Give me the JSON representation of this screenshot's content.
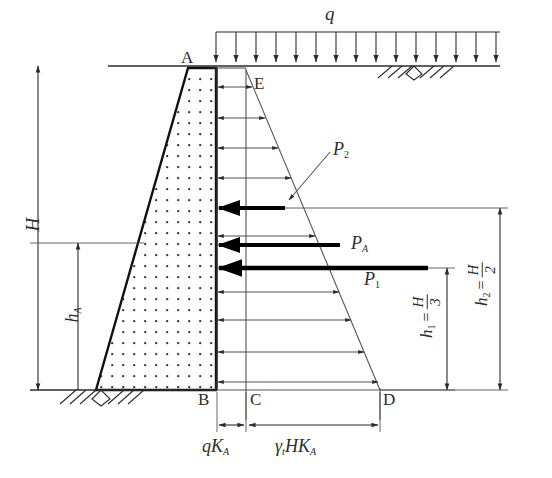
{
  "figure": {
    "type": "engineering-diagram",
    "colors": {
      "line": "#2b2b2b",
      "thin_line": "#555555",
      "bold_force": "#000000",
      "fill_dots": "#333333",
      "background": "#ffffff"
    }
  },
  "loads": {
    "surcharge_label": "q",
    "surcharge_arrow_count": 15
  },
  "points": {
    "A": "A",
    "B": "B",
    "C": "C",
    "D": "D",
    "E": "E"
  },
  "forces": [
    {
      "name": "P_2",
      "base": "P",
      "sub": "2"
    },
    {
      "name": "P_A",
      "base": "P",
      "sub": "A"
    },
    {
      "name": "P_1",
      "base": "P",
      "sub": "1"
    }
  ],
  "dimensions": {
    "H": {
      "base": "H",
      "sub": ""
    },
    "hA": {
      "base": "h",
      "sub": "A"
    },
    "h1": {
      "base": "h",
      "sub": "1",
      "equals": "=",
      "num": "H",
      "den": "3"
    },
    "h2": {
      "base": "h",
      "sub": "2",
      "equals": "=",
      "num": "H",
      "den": "2"
    }
  },
  "pressure_labels": {
    "surcharge_pressure": {
      "q": "q",
      "K": "K",
      "sub": "A"
    },
    "soil_pressure": {
      "gamma": "γ",
      "gsub": "t",
      "H": "H",
      "K": "K",
      "sub": "A"
    }
  },
  "pressure_arrows": {
    "rows": 11,
    "note": "horizontal arrows from wall face, trapezoidal total distribution"
  }
}
